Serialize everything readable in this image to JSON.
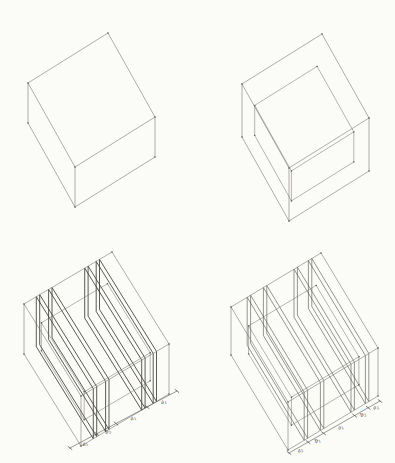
{
  "page": {
    "background": "#fbfbf8"
  },
  "diagram": {
    "stroke": {
      "line": "#6e6d66",
      "slab": "#504f48",
      "slab_emphasis": "#3e3d37",
      "dimension": "#45443e",
      "label": "#33322d",
      "dot": "#55544d"
    },
    "panels": [
      {
        "name": "panel-plain-box",
        "box": {
          "origin": [
            108,
            33
          ],
          "u": [
            -80,
            50
          ],
          "w": [
            47,
            84
          ],
          "h": 40
        }
      },
      {
        "name": "panel-box-with-inner-box",
        "box": {
          "origin": [
            322,
            34
          ],
          "u": [
            -80,
            50
          ],
          "w": [
            47,
            84
          ],
          "h": 53
        },
        "inner": {
          "scale": 0.78,
          "shift_u": 0.12,
          "shift_w": 0.1,
          "drop": 18,
          "h": 30
        }
      },
      {
        "name": "panel-sliced-box-a",
        "box": {
          "origin": [
            112,
            252
          ],
          "u": [
            -88,
            52
          ],
          "w": [
            57,
            92
          ],
          "h": 50
        },
        "inner": {
          "scale": 0.75,
          "shift_u": 0.13,
          "shift_w": 0.12,
          "drop": 14,
          "h": 28
        },
        "slabs": {
          "positions": [
            0.14,
            0.28,
            0.69,
            0.82
          ],
          "thickness": 0.038,
          "emphasis": true
        },
        "dimension": {
          "start": [
            70,
            448
          ],
          "end": [
            177,
            391
          ],
          "ticks": [
            0,
            0.25,
            0.43,
            0.72,
            1
          ],
          "labels": [
            {
              "base": "a",
              "sub": "1"
            },
            {
              "base": "b",
              "sub": "2"
            },
            {
              "base": "a",
              "sub": "1"
            },
            {
              "base": "a",
              "sub": "1"
            }
          ]
        }
      },
      {
        "name": "panel-sliced-box-b",
        "box": {
          "origin": [
            321,
            253
          ],
          "u": [
            -90,
            54
          ],
          "w": [
            57,
            95
          ],
          "h": 48
        },
        "inner": {
          "scale": 0.75,
          "shift_u": 0.13,
          "shift_w": 0.12,
          "drop": 14,
          "h": 28
        },
        "slabs": {
          "positions": [
            0.18,
            0.36,
            0.7,
            0.86
          ],
          "thickness": 0.038,
          "emphasis": false
        },
        "dimension": {
          "start": [
            289,
            453
          ],
          "end": [
            380,
            401
          ],
          "ticks": [
            0,
            0.21,
            0.38,
            0.72,
            0.87,
            1
          ],
          "labels": [
            {
              "base": "a",
              "sub": "2"
            },
            {
              "base": "b",
              "sub": "1"
            },
            {
              "base": "a",
              "sub": "1"
            },
            {
              "base": "b",
              "sub": "2"
            },
            {
              "base": "a",
              "sub": "2"
            }
          ]
        }
      }
    ]
  }
}
